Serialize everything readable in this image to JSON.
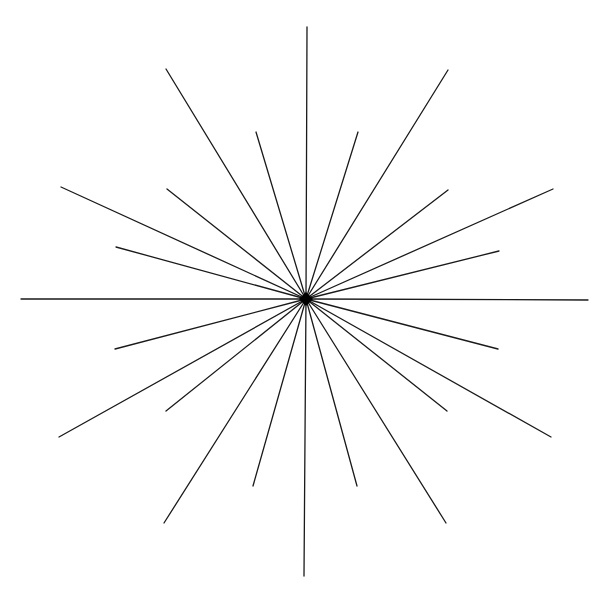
{
  "diagram": {
    "type": "starburst",
    "center": [
      306,
      299
    ],
    "line_color": "#1a1a1a",
    "background": "#ffffff",
    "endpoints": [
      [
        307,
        27
      ],
      [
        448,
        70
      ],
      [
        358,
        132
      ],
      [
        448,
        190
      ],
      [
        553,
        189
      ],
      [
        499,
        251
      ],
      [
        588,
        300
      ],
      [
        498,
        349
      ],
      [
        551,
        437
      ],
      [
        447,
        411
      ],
      [
        446,
        523
      ],
      [
        357,
        486
      ],
      [
        304,
        576
      ],
      [
        253,
        486
      ],
      [
        164,
        523
      ],
      [
        166,
        411
      ],
      [
        59,
        437
      ],
      [
        115,
        349
      ],
      [
        21,
        299
      ],
      [
        116,
        247
      ],
      [
        61,
        187
      ],
      [
        167,
        189
      ],
      [
        256,
        132
      ],
      [
        166,
        69
      ]
    ]
  }
}
